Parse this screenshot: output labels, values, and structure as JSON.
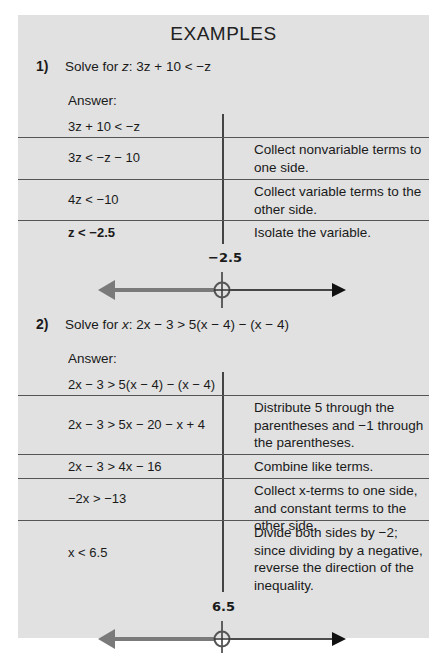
{
  "page": {
    "title": "EXAMPLES"
  },
  "examples": [
    {
      "number": "1)",
      "prompt_prefix": "Solve for ",
      "variable": "z",
      "prompt_equation": ": 3z + 10 < −z",
      "answer_label": "Answer:",
      "steps": [
        {
          "expression": "3z + 10 < −z",
          "explanation": ""
        },
        {
          "expression": "3z < −z − 10",
          "explanation": "Collect nonvariable terms to one side."
        },
        {
          "expression": "4z < −10",
          "explanation": "Collect variable terms to the other side."
        },
        {
          "expression": "z < −2.5",
          "explanation": "Isolate the variable."
        }
      ],
      "number_line": {
        "point_label": "−2.5",
        "point_type": "open-circle",
        "shaded_direction": "left",
        "shade_color": "#7a7a7a",
        "line_color": "#111111"
      }
    },
    {
      "number": "2)",
      "prompt_prefix": "Solve for ",
      "variable": "x",
      "prompt_equation": ": 2x − 3 > 5(x − 4) − (x − 4)",
      "answer_label": "Answer:",
      "steps": [
        {
          "expression": "2x − 3 > 5(x − 4) − (x − 4)",
          "explanation": ""
        },
        {
          "expression": "2x − 3 > 5x − 20 − x + 4",
          "explanation": "Distribute 5 through the parentheses and −1 through the parentheses."
        },
        {
          "expression": "2x − 3 > 4x − 16",
          "explanation": "Combine like terms."
        },
        {
          "expression": "−2x > −13",
          "explanation": "Collect x-terms to one side, and constant terms to the other side."
        },
        {
          "expression": "x < 6.5",
          "explanation": "Divide both sides by −2; since dividing by a negative, reverse the direction of the inequality."
        }
      ],
      "number_line": {
        "point_label": "6.5",
        "point_type": "open-circle",
        "shaded_direction": "left",
        "shade_color": "#7a7a7a",
        "line_color": "#111111"
      }
    }
  ],
  "colors": {
    "panel_background": "#e1e1e1",
    "rule": "#555555",
    "shaded_ray": "#7a7a7a",
    "open_circle": "#555555"
  }
}
